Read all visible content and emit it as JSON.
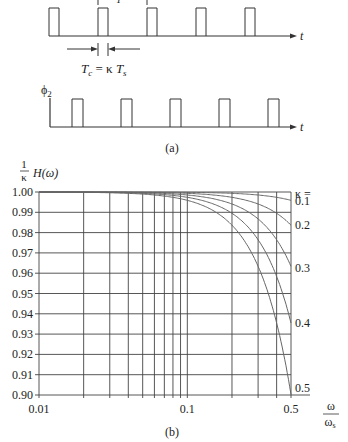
{
  "figure_a": {
    "caption": "(a)",
    "phi1": {
      "pulses_x": [
        49,
        98,
        147,
        196,
        245
      ],
      "pulse_width": 10,
      "period_label_partial": "T_s"
    },
    "phi2": {
      "label": "ϕ",
      "subscript": "2",
      "pulses_x": [
        72,
        121,
        170,
        219,
        268
      ],
      "pulse_width": 11
    },
    "time_axis_label": "t",
    "tc_label": {
      "t": "T",
      "c_sub": "c",
      "eq": " = κ ",
      "t2": "T",
      "s_sub": "s"
    }
  },
  "figure_b": {
    "caption": "(b)",
    "kappa_header": "κ ="
  },
  "chart_data": {
    "type": "line",
    "title": "",
    "ylabel": "(1/κ) H(ω)",
    "xlabel": "ω/ω_s",
    "xscale": "log",
    "xlim": [
      0.01,
      0.5
    ],
    "ylim": [
      0.9,
      1.0
    ],
    "grid": true,
    "x_tick_labels": [
      "0.01",
      "0.1",
      "0.5"
    ],
    "x_gridlines": [
      0.01,
      0.02,
      0.03,
      0.04,
      0.05,
      0.06,
      0.07,
      0.08,
      0.09,
      0.1,
      0.2,
      0.3,
      0.4,
      0.5
    ],
    "y_tick_labels": [
      "1.00",
      "0.99",
      "0.98",
      "0.97",
      "0.96",
      "0.95",
      "0.94",
      "0.93",
      "0.92",
      "0.91",
      "0.90"
    ],
    "legend_title": "κ =",
    "formula": "H(ω)/κ = sin(πκω/ω_s)/(πκω/ω_s)",
    "series": [
      {
        "name": "0.1",
        "kappa": 0.1,
        "value_at_0.5": 0.996
      },
      {
        "name": "0.2",
        "kappa": 0.2,
        "value_at_0.5": 0.984
      },
      {
        "name": "0.3",
        "kappa": 0.3,
        "value_at_0.5": 0.963
      },
      {
        "name": "0.4",
        "kappa": 0.4,
        "value_at_0.5": 0.936
      },
      {
        "name": "0.5",
        "kappa": 0.5,
        "value_at_0.5": 0.9
      }
    ]
  }
}
